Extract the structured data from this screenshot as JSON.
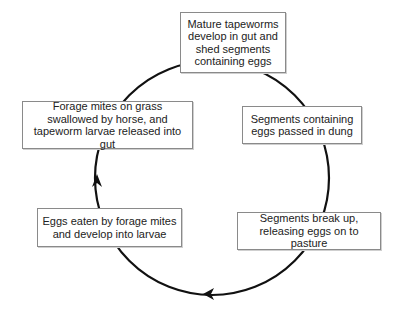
{
  "diagram": {
    "type": "life-cycle",
    "stages": [
      {
        "id": "mature",
        "text": "Mature tapeworms develop in gut and shed segments containing eggs"
      },
      {
        "id": "passed",
        "text": "Segments containing eggs passed in dung"
      },
      {
        "id": "breakup",
        "text": "Segments break up, releasing eggs on to pasture"
      },
      {
        "id": "eaten",
        "text": "Eggs eaten by forage mites and develop into larvae"
      },
      {
        "id": "swallowed",
        "text": "Forage mites on grass swallowed by horse, and tapeworm larvae released into gut"
      }
    ],
    "arrows": [
      {
        "from": "mature",
        "to": "passed"
      },
      {
        "from": "passed",
        "to": "breakup"
      },
      {
        "from": "breakup",
        "to": "eaten"
      },
      {
        "from": "eaten",
        "to": "swallowed"
      },
      {
        "from": "swallowed",
        "to": "mature"
      }
    ],
    "direction": "clockwise",
    "colors": {
      "line": "#111111",
      "box_border": "#8a8a8a",
      "text": "#222222"
    }
  }
}
